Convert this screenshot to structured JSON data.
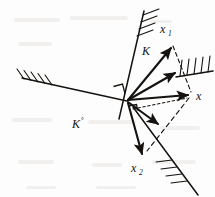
{
  "figure": {
    "name": "polar-cone-projection-diagram",
    "background_color": "#fdfdfd",
    "ink_color": "#15120f",
    "labels": {
      "cone": "K",
      "polar_cone_base": "K",
      "polar_cone_superscript": "°",
      "polar_cone_full": "K°",
      "vector_x": "x",
      "vector_x1_base": "x",
      "vector_x1_sub": "1",
      "vector_x1_full": "x₁",
      "vector_x2_base": "x",
      "vector_x2_sub": "2",
      "vector_x2_full": "x₂"
    },
    "apex": {
      "x": 127,
      "y": 101
    },
    "vectors": [
      {
        "name": "x1",
        "label": "x₁",
        "from": [
          127,
          101
        ],
        "to": [
          173,
          45
        ],
        "style": "solid-arrow"
      },
      {
        "name": "x-projection-mid",
        "label": "",
        "from": [
          127,
          101
        ],
        "to": [
          177,
          72
        ],
        "style": "solid-arrow"
      },
      {
        "name": "x",
        "label": "x",
        "from": [
          127,
          101
        ],
        "to": [
          190,
          95
        ],
        "style": "solid-arrow"
      },
      {
        "name": "x-inner-lower",
        "label": "",
        "from": [
          127,
          101
        ],
        "to": [
          160,
          126
        ],
        "style": "solid-arrow"
      },
      {
        "name": "x2",
        "label": "x₂",
        "from": [
          127,
          101
        ],
        "to": [
          143,
          157
        ],
        "style": "solid-arrow"
      }
    ],
    "dashed_lines": [
      {
        "name": "x1-to-x-dashed",
        "from": [
          173,
          45
        ],
        "to": [
          191,
          93
        ]
      },
      {
        "name": "x-to-x2-dashed",
        "from": [
          190,
          96
        ],
        "to": [
          148,
          150
        ]
      },
      {
        "name": "apex-to-x-dotted",
        "from": [
          133,
          108
        ],
        "to": [
          188,
          97
        ]
      }
    ],
    "boundaries": [
      {
        "name": "left-ray",
        "from": [
          22,
          78
        ],
        "to": [
          127,
          101
        ],
        "hatch_side": "above",
        "hatch_count": 5
      },
      {
        "name": "cone-upper-ray",
        "from": [
          143,
          12
        ],
        "to": [
          127,
          101
        ],
        "hatch_count": 4,
        "hatch_side": "right"
      },
      {
        "name": "upper-right-ray",
        "from": [
          213,
          72
        ],
        "to": [
          177,
          73
        ],
        "hatch_count": 5,
        "hatch_side": "above"
      },
      {
        "name": "lower-right-ray",
        "from": [
          148,
          149
        ],
        "to": [
          197,
          195
        ],
        "hatch_count": 4,
        "hatch_side": "left"
      }
    ],
    "right_angle_markers": [
      {
        "name": "right-angle-upper-left",
        "x": 117,
        "y": 88
      },
      {
        "name": "right-angle-lower",
        "x": 131,
        "y": 105
      }
    ]
  }
}
